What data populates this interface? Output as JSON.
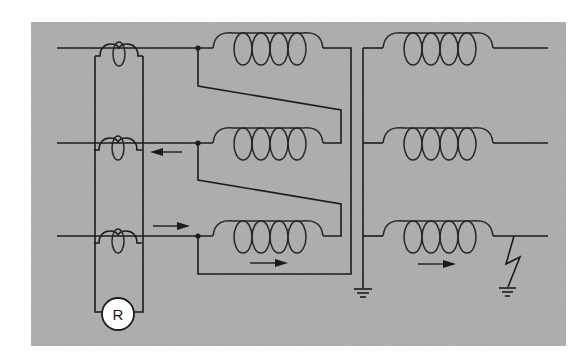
{
  "diagram": {
    "type": "three-phase transformer protection schematic",
    "background_color": "#a6a6a6",
    "line_color": "#1c1c1c",
    "relay": {
      "label": "R"
    },
    "components": [
      "current transformer (phase 1)",
      "current transformer (phase 2)",
      "current transformer (phase 3)",
      "relay R",
      "primary winding 1",
      "primary winding 2",
      "primary winding 3",
      "secondary winding 1",
      "secondary winding 2",
      "secondary winding 3",
      "primary neutral ground",
      "ground fault on phase 3",
      "fault ground"
    ],
    "arrows": [
      {
        "location": "phase 2 line, left of primary",
        "direction": "left"
      },
      {
        "location": "phase 3 line, left of primary",
        "direction": "right"
      },
      {
        "location": "below primary winding 3",
        "direction": "right"
      },
      {
        "location": "below secondary winding 3",
        "direction": "right"
      }
    ]
  }
}
